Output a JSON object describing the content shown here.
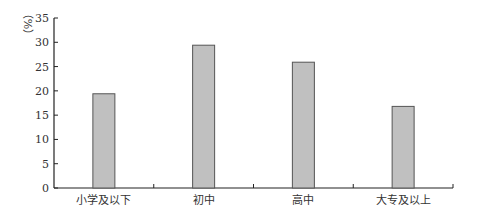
{
  "chart_data": {
    "type": "bar",
    "title": "",
    "xlabel": "",
    "ylabel": "（%）",
    "categories": [
      "小学及以下",
      "初中",
      "高中",
      "大专及以上"
    ],
    "values": [
      19.4,
      29.4,
      25.9,
      16.8
    ],
    "ylim": [
      0,
      35
    ],
    "yticks": [
      0,
      5,
      10,
      15,
      20,
      25,
      30,
      35
    ],
    "grid": false,
    "legend": null,
    "bar_color": "#c0c0c0",
    "bar_edge_color": "#555555"
  }
}
